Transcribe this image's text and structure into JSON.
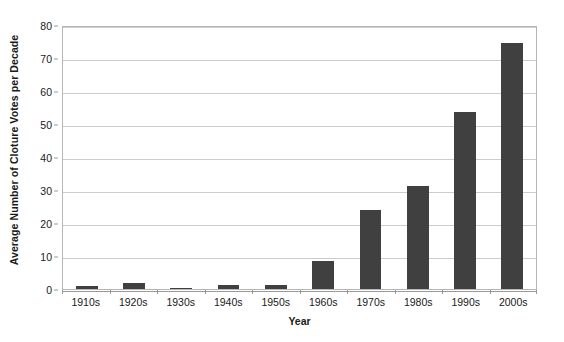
{
  "chart_data": {
    "type": "bar",
    "title": "",
    "xlabel": "Year",
    "ylabel": "Average Number of Cloture Votes per Decade",
    "categories": [
      "1910s",
      "1920s",
      "1930s",
      "1940s",
      "1950s",
      "1960s",
      "1970s",
      "1980s",
      "1990s",
      "2000s"
    ],
    "values": [
      1.0,
      1.7,
      0.4,
      1.3,
      1.1,
      8.5,
      24.0,
      31.3,
      53.6,
      74.7
    ],
    "ylim": [
      0,
      80
    ],
    "yticks": [
      0,
      10,
      20,
      30,
      40,
      50,
      60,
      70,
      80
    ],
    "ytick_labels": [
      "0",
      "10",
      "20",
      "30",
      "40",
      "50",
      "60",
      "70",
      "80"
    ],
    "grid": "horizontal",
    "legend": "none",
    "bar_color": "#404040",
    "grid_color": "#cccccc",
    "axis_color": "#9a9a9a",
    "plot_border_color": "#b6b6b6",
    "background_color": "#ffffff"
  }
}
